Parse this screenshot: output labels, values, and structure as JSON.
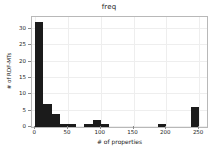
{
  "chart_data": {
    "type": "bar",
    "title": "freq",
    "xlabel": "# of properties",
    "ylabel": "# of RDF-MTs",
    "xlim": [
      -5,
      262
    ],
    "ylim": [
      0,
      33.6
    ],
    "grid": true,
    "legend": null,
    "bin_width": 12.5,
    "xticks": [
      0,
      50,
      100,
      150,
      200,
      250
    ],
    "xticklabels": [
      "0",
      "50",
      "100",
      "150",
      "200",
      "250"
    ],
    "yticks": [
      0,
      5,
      10,
      15,
      20,
      25,
      30
    ],
    "yticklabels": [
      "0",
      "5",
      "10",
      "15",
      "20",
      "25",
      "30"
    ],
    "bar_color": "#1b1b1b",
    "bins": [
      {
        "x0": 0.0,
        "x1": 12.5,
        "value": 32
      },
      {
        "x0": 12.5,
        "x1": 25.0,
        "value": 7
      },
      {
        "x0": 25.0,
        "x1": 37.5,
        "value": 4
      },
      {
        "x0": 37.5,
        "x1": 50.0,
        "value": 1
      },
      {
        "x0": 50.0,
        "x1": 62.5,
        "value": 1
      },
      {
        "x0": 62.5,
        "x1": 75.0,
        "value": 0
      },
      {
        "x0": 75.0,
        "x1": 87.5,
        "value": 1
      },
      {
        "x0": 87.5,
        "x1": 100.0,
        "value": 2
      },
      {
        "x0": 100.0,
        "x1": 112.5,
        "value": 1
      },
      {
        "x0": 112.5,
        "x1": 125.0,
        "value": 0
      },
      {
        "x0": 125.0,
        "x1": 137.5,
        "value": 0
      },
      {
        "x0": 137.5,
        "x1": 150.0,
        "value": 0
      },
      {
        "x0": 150.0,
        "x1": 162.5,
        "value": 0
      },
      {
        "x0": 162.5,
        "x1": 175.0,
        "value": 0
      },
      {
        "x0": 175.0,
        "x1": 187.5,
        "value": 0
      },
      {
        "x0": 187.5,
        "x1": 200.0,
        "value": 1
      },
      {
        "x0": 200.0,
        "x1": 212.5,
        "value": 0
      },
      {
        "x0": 212.5,
        "x1": 225.0,
        "value": 0
      },
      {
        "x0": 225.0,
        "x1": 237.5,
        "value": 0
      },
      {
        "x0": 237.5,
        "x1": 250.0,
        "value": 6
      }
    ]
  }
}
